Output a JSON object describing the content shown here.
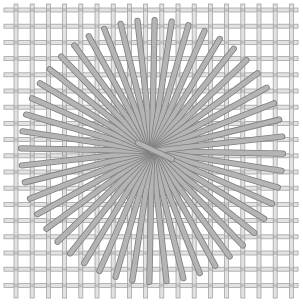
{
  "image": {
    "description": "Woven wire mesh grid with a radial starburst of gray rods",
    "width": 303,
    "height": 305
  },
  "grid": {
    "x_start": 16,
    "y_start": 10,
    "spacing": 16.2,
    "count_x": 18,
    "count_y": 18,
    "extent_min": 4,
    "extent_max": 298,
    "bar_width": 4,
    "fill": "#e2e2e2",
    "stroke": "#a4a4a4",
    "knot": "#8a8a8a"
  },
  "starburst": {
    "center_x": 152,
    "center_y": 151,
    "radius": 131,
    "rod_count": 48,
    "rod_width": 5,
    "fill": "#b4b4b4",
    "stroke": "#7e7e7e",
    "top_rod": {
      "x1": 138,
      "y1": 143,
      "x2": 172,
      "y2": 159
    }
  }
}
